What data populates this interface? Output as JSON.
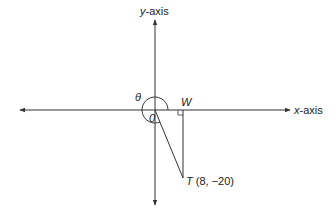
{
  "diagram": {
    "y_axis_label": {
      "var": "y",
      "suffix": "-axis"
    },
    "x_axis_label": {
      "var": "x",
      "suffix": "-axis"
    },
    "origin_label": "0",
    "angle_label": "θ",
    "point_w_label": "W",
    "point_t": {
      "name": "T",
      "coords": "(8, −20)"
    },
    "colors": {
      "line": "#333333",
      "text": "#222222",
      "background": "#ffffff"
    }
  }
}
